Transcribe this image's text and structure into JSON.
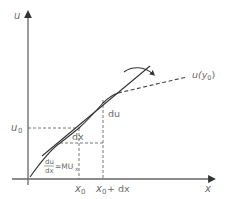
{
  "diagram": {
    "axes": {
      "y_label": "u",
      "x_label": "x"
    },
    "labels": {
      "u0": "u",
      "u0_sub": "0",
      "x0": "x",
      "x0_sub": "0",
      "x0dx_main": "x",
      "x0dx_sub": "0",
      "x0dx_tail": "+ dx",
      "dx": "dx",
      "du": "du",
      "curve_label_main": "u(y",
      "curve_label_sub": "0",
      "curve_label_close": ")",
      "mu_num": "du",
      "mu_den": "dx",
      "mu_eq": "=MU",
      "mu_sub": "x"
    },
    "colors": {
      "axis": "#555555",
      "curve": "#333333",
      "dashed": "#666666",
      "text": "#6b6b6b"
    }
  }
}
